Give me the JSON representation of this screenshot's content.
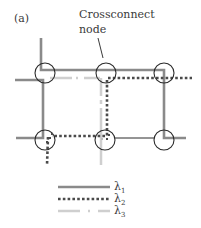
{
  "figure": {
    "panel_label": "(a)",
    "callout": {
      "line1": "Crossconnect",
      "line2": "node"
    }
  },
  "colors": {
    "lambda1": "#8a8a8a",
    "lambda2": "#4a4a4a",
    "lambda3": "#cfcfcf",
    "node_outline": "#2a2a2a",
    "thin_link": "#2a2a2a"
  },
  "nodes": [
    {
      "id": "top-left",
      "x": 45,
      "y": 73
    },
    {
      "id": "top-middle",
      "x": 106,
      "y": 73
    },
    {
      "id": "top-right",
      "x": 164,
      "y": 73
    },
    {
      "id": "bottom-left",
      "x": 45,
      "y": 140
    },
    {
      "id": "bottom-middle",
      "x": 105,
      "y": 140
    },
    {
      "id": "bottom-right",
      "x": 164,
      "y": 140
    }
  ],
  "legend": [
    {
      "symbol": "λ",
      "subscript": "1",
      "style": "solid"
    },
    {
      "symbol": "λ",
      "subscript": "2",
      "style": "dotted"
    },
    {
      "symbol": "λ",
      "subscript": "3",
      "style": "dash-dot"
    }
  ]
}
